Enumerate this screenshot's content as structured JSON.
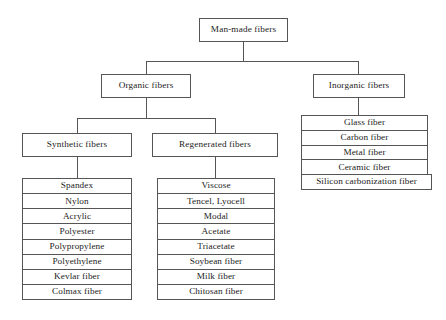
{
  "diagram": {
    "type": "hierarchy-tree",
    "colors": {
      "background": "#ffffff",
      "box_border": "#555555",
      "text": "#1c1c1c",
      "connector": "#555555"
    },
    "root": {
      "label": "Man-made fibers"
    },
    "level2": {
      "organic": {
        "label": "Organic fibers"
      },
      "inorganic": {
        "label": "Inorganic fibers"
      }
    },
    "level3": {
      "synthetic": {
        "label": "Synthetic fibers"
      },
      "regenerated": {
        "label": "Regenerated fibers"
      }
    },
    "leaves": {
      "synthetic_fibers": [
        "Spandex",
        "Nylon",
        "Acrylic",
        "Polyester",
        "Polypropylene",
        "Polyethylene",
        "Kevlar fiber",
        "Colmax fiber"
      ],
      "regenerated_fibers": [
        "Viscose",
        "Tencel, Lyocell",
        "Modal",
        "Acetate",
        "Triacetate",
        "Soybean fiber",
        "Milk fiber",
        "Chitosan fiber"
      ],
      "inorganic_fibers": [
        "Glass fiber",
        "Carbon fiber",
        "Metal fiber",
        "Ceramic fiber",
        "Silicon carbonization fiber"
      ]
    }
  }
}
